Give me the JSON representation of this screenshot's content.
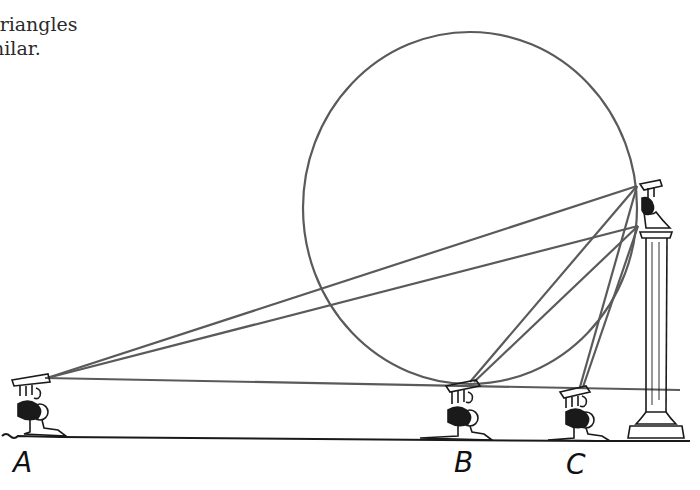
{
  "caption": {
    "line1": "triangles",
    "line2": "nilar."
  },
  "figure": {
    "circle": {
      "cx": 470,
      "cy": 208,
      "rx": 167,
      "ry": 176
    },
    "statue_top": [
      637,
      186
    ],
    "statue_bottom": [
      638,
      226
    ],
    "eye_line": {
      "from": [
        45,
        378
      ],
      "to": [
        680,
        390
      ]
    },
    "ground_y": 438,
    "line_color": "#5a5a5a"
  },
  "labels": {
    "A": "A",
    "B": "B",
    "C": "C"
  }
}
